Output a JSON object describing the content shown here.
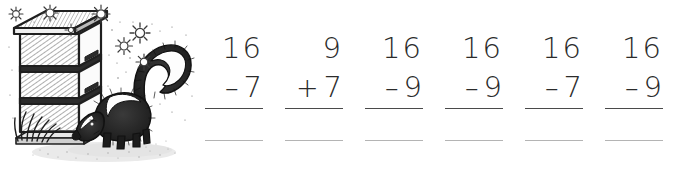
{
  "illustration": {
    "name": "beehive-and-skunk-drawing",
    "description": "Pen and ink drawing of a stacked beehive with a skunk beside it and sparkles in the air",
    "ink_color": "#2b2b2b",
    "elements": [
      "beehive",
      "hive-lid",
      "hive-box",
      "skunk",
      "skunk-tail",
      "grass",
      "ground",
      "sparkle-stars"
    ]
  },
  "worksheet": {
    "background_color": "#ffffff",
    "digit_color": "#2b2b2b",
    "rule_color": "#4a4a4a",
    "answer_line_color": "#b4b4b4",
    "problems": [
      {
        "top": "16",
        "operator": "–",
        "operand": "7",
        "answer": ""
      },
      {
        "top": "9",
        "operator": "+",
        "operand": "7",
        "answer": ""
      },
      {
        "top": "16",
        "operator": "–",
        "operand": "9",
        "answer": ""
      },
      {
        "top": "16",
        "operator": "–",
        "operand": "9",
        "answer": ""
      },
      {
        "top": "16",
        "operator": "–",
        "operand": "7",
        "answer": ""
      },
      {
        "top": "16",
        "operator": "–",
        "operand": "9",
        "answer": ""
      }
    ]
  }
}
